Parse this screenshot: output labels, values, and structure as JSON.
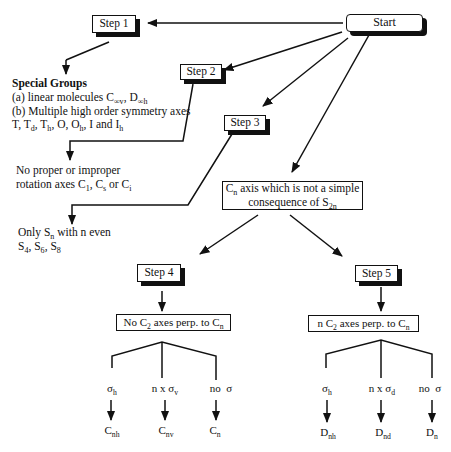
{
  "diagram": {
    "nodes": {
      "start": {
        "label": "Start"
      },
      "step1": {
        "label": "Step 1"
      },
      "step2": {
        "label": "Step 2"
      },
      "step3": {
        "label": "Step 3"
      },
      "step4": {
        "label": "Step 4"
      },
      "step5": {
        "label": "Step 5"
      },
      "cn_axis": {
        "line1_main": "C",
        "line1_sub": "n",
        "line1_rest": " axis which is not a simple",
        "line2_main": "consequence of S",
        "line2_sub": "2n"
      },
      "no_c2": {
        "prefix": "No C",
        "sub1": "2",
        "middle": " axes perp. to C",
        "sub2": "n"
      },
      "n_c2": {
        "prefix": "n C",
        "sub1": "2",
        "middle": " axes perp. to C",
        "sub2": "n"
      }
    },
    "special_groups": {
      "title": "Special Groups",
      "line_a": {
        "text": "(a) linear molecules C",
        "sub1": "∞v",
        "sep": ", D",
        "sub2": "∞h"
      },
      "line_b": "(b) Multiple high order symmetry axes",
      "line_c": {
        "t1": "T, T",
        "s1": "d",
        "t2": ", T",
        "s2": "h",
        "t3": ", O, O",
        "s3": "h",
        "t4": ", I and I",
        "s4": "h"
      }
    },
    "no_rotation": {
      "line1": "No proper or improper",
      "line2": {
        "t1": "rotation axes C",
        "s1": "1",
        "t2": ", C",
        "s2": "s",
        "t3": " or C",
        "s3": "i"
      }
    },
    "only_sn": {
      "line1": {
        "t1": "Only S",
        "s1": "n",
        "t2": " with n even"
      },
      "line2": {
        "t1": "S",
        "s1": "4",
        "t2": ", S",
        "s2": "6",
        "t3": ", S",
        "s3": "8"
      }
    },
    "step4_branches": [
      {
        "cond_main": "σ",
        "cond_sub": "h",
        "result_main": "C",
        "result_sub": "nh"
      },
      {
        "cond_main": "n x σ",
        "cond_sub": "v",
        "result_main": "C",
        "result_sub": "nv"
      },
      {
        "cond_main": "no  σ",
        "cond_sub": "",
        "result_main": "C",
        "result_sub": "n"
      }
    ],
    "step5_branches": [
      {
        "cond_main": "σ",
        "cond_sub": "h",
        "result_main": "D",
        "result_sub": "nh"
      },
      {
        "cond_main": "n x σ",
        "cond_sub": "d",
        "result_main": "D",
        "result_sub": "nd"
      },
      {
        "cond_main": "no  σ",
        "cond_sub": "",
        "result_main": "D",
        "result_sub": "n"
      }
    ]
  }
}
